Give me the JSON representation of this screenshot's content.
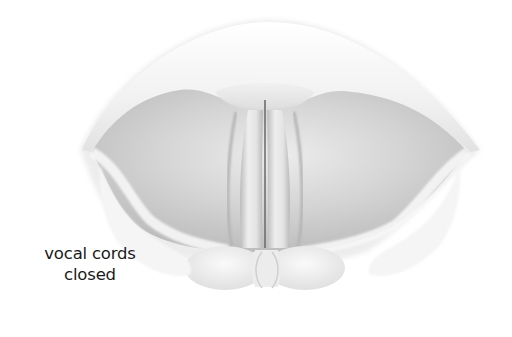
{
  "figure": {
    "label": {
      "line1": "vocal cords",
      "line2": "closed"
    },
    "colors": {
      "background": "#ffffff",
      "tissue_light": "#f4f4f4",
      "tissue_mid": "#d6d6d6",
      "tissue_dark": "#a8a8a8",
      "cord_gap": "#6e6e6e",
      "text": "#1a1a1a"
    }
  }
}
